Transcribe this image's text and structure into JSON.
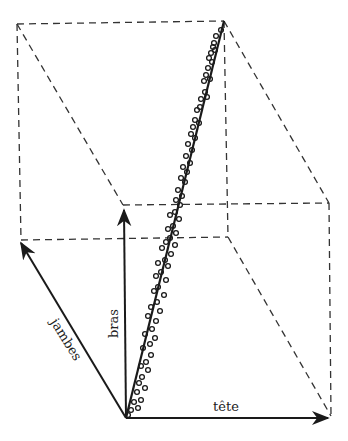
{
  "labels": {
    "x_axis": "tête",
    "y_axis": "bras",
    "z_axis": "jambes"
  },
  "colors": {
    "ink": "#1a1a1a",
    "dash": "#333333",
    "background": "#ffffff"
  },
  "geometry": {
    "origin": [
      126,
      418
    ],
    "tete_end": [
      328,
      418
    ],
    "bras_end": [
      124,
      210
    ],
    "jambes_end": [
      21,
      243
    ],
    "box_edges": [
      [
        [
          17,
          24
        ],
        [
          224,
          21
        ]
      ],
      [
        [
          17,
          24
        ],
        [
          21,
          240
        ]
      ],
      [
        [
          224,
          21
        ],
        [
          228,
          237
        ]
      ],
      [
        [
          21,
          240
        ],
        [
          228,
          237
        ]
      ],
      [
        [
          17,
          24
        ],
        [
          123,
          205
        ]
      ],
      [
        [
          224,
          21
        ],
        [
          329,
          203
        ]
      ],
      [
        [
          123,
          205
        ],
        [
          329,
          203
        ]
      ],
      [
        [
          329,
          203
        ],
        [
          331,
          416
        ]
      ],
      [
        [
          228,
          237
        ],
        [
          331,
          416
        ]
      ]
    ],
    "fit_line": [
      [
        126,
        418
      ],
      [
        224,
        21
      ]
    ]
  },
  "chart_data": {
    "type": "scatter",
    "title": "",
    "axes": [
      "tête",
      "bras",
      "jambes"
    ],
    "points_px": [
      [
        221,
        30
      ],
      [
        216,
        36
      ],
      [
        214,
        43
      ],
      [
        213,
        47
      ],
      [
        211,
        53
      ],
      [
        215,
        50
      ],
      [
        209,
        58
      ],
      [
        212,
        62
      ],
      [
        208,
        68
      ],
      [
        206,
        75
      ],
      [
        210,
        79
      ],
      [
        204,
        81
      ],
      [
        205,
        92
      ],
      [
        201,
        99
      ],
      [
        207,
        97
      ],
      [
        200,
        107
      ],
      [
        197,
        110
      ],
      [
        195,
        120
      ],
      [
        199,
        123
      ],
      [
        193,
        127
      ],
      [
        191,
        134
      ],
      [
        195,
        138
      ],
      [
        188,
        144
      ],
      [
        192,
        150
      ],
      [
        186,
        156
      ],
      [
        190,
        163
      ],
      [
        183,
        167
      ],
      [
        187,
        172
      ],
      [
        181,
        178
      ],
      [
        185,
        182
      ],
      [
        178,
        190
      ],
      [
        182,
        196
      ],
      [
        176,
        200
      ],
      [
        180,
        205
      ],
      [
        175,
        212
      ],
      [
        170,
        215
      ],
      [
        179,
        219
      ],
      [
        173,
        226
      ],
      [
        168,
        229
      ],
      [
        176,
        233
      ],
      [
        170,
        238
      ],
      [
        166,
        242
      ],
      [
        175,
        245
      ],
      [
        162,
        248
      ],
      [
        171,
        254
      ],
      [
        165,
        260
      ],
      [
        158,
        263
      ],
      [
        168,
        266
      ],
      [
        161,
        272
      ],
      [
        156,
        276
      ],
      [
        166,
        280
      ],
      [
        158,
        287
      ],
      [
        154,
        291
      ],
      [
        164,
        295
      ],
      [
        157,
        302
      ],
      [
        151,
        307
      ],
      [
        160,
        311
      ],
      [
        148,
        316
      ],
      [
        156,
        321
      ],
      [
        152,
        329
      ],
      [
        145,
        334
      ],
      [
        155,
        338
      ],
      [
        150,
        344
      ],
      [
        143,
        348
      ],
      [
        151,
        355
      ],
      [
        146,
        362
      ],
      [
        141,
        366
      ],
      [
        148,
        370
      ],
      [
        142,
        377
      ],
      [
        139,
        383
      ],
      [
        145,
        388
      ],
      [
        137,
        392
      ],
      [
        141,
        400
      ],
      [
        134,
        402
      ],
      [
        138,
        408
      ],
      [
        131,
        410
      ],
      [
        128,
        415
      ]
    ],
    "fit_line": {
      "from": [
        126,
        418
      ],
      "to": [
        224,
        21
      ]
    }
  }
}
